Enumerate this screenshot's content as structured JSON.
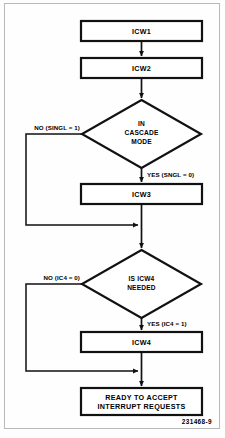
{
  "figure": {
    "type": "flowchart",
    "figure_code": "231468-9",
    "nodes": [
      {
        "id": "icw1",
        "shape": "process",
        "label": "ICW1"
      },
      {
        "id": "icw2",
        "shape": "process",
        "label": "ICW2"
      },
      {
        "id": "cascade_decision",
        "shape": "decision",
        "label_lines": [
          "IN",
          "CASCADE",
          "MODE"
        ]
      },
      {
        "id": "icw3",
        "shape": "process",
        "label": "ICW3"
      },
      {
        "id": "icw4_decision",
        "shape": "decision",
        "label_lines": [
          "IS ICW4",
          "NEEDED"
        ]
      },
      {
        "id": "icw4",
        "shape": "process",
        "label": "ICW4"
      },
      {
        "id": "ready",
        "shape": "process",
        "label_lines": [
          "READY TO ACCEPT",
          "INTERRUPT REQUESTS"
        ]
      }
    ],
    "edges": [
      {
        "from": "icw1",
        "to": "icw2",
        "label": ""
      },
      {
        "from": "icw2",
        "to": "cascade_decision",
        "label": ""
      },
      {
        "from": "cascade_decision",
        "to": "icw4_decision",
        "label": "NO (SINGL = 1)",
        "branch": "no"
      },
      {
        "from": "cascade_decision",
        "to": "icw3",
        "label": "YES (SNGL = 0)",
        "branch": "yes"
      },
      {
        "from": "icw3",
        "to": "icw4_decision",
        "label": ""
      },
      {
        "from": "icw4_decision",
        "to": "ready",
        "label": "NO (IC4 = 0)",
        "branch": "no"
      },
      {
        "from": "icw4_decision",
        "to": "icw4",
        "label": "YES (IC4 = 1)",
        "branch": "yes"
      },
      {
        "from": "icw4",
        "to": "ready",
        "label": ""
      }
    ]
  },
  "labels": {
    "icw1": "ICW1",
    "icw2": "ICW2",
    "icw3": "ICW3",
    "icw4": "ICW4",
    "cascade_line1": "IN",
    "cascade_line2": "CASCADE",
    "cascade_line3": "MODE",
    "icw4q_line1": "IS ICW4",
    "icw4q_line2": "NEEDED",
    "ready_line1": "READY TO ACCEPT",
    "ready_line2": "INTERRUPT REQUESTS",
    "no_singl": "NO (SINGL = 1)",
    "yes_sngl": "YES (SNGL = 0)",
    "no_ic4": "NO (IC4 = 0)",
    "yes_ic4": "YES (IC4 = 1)",
    "figure_code": "231468-9"
  },
  "colors": {
    "stroke": "#111111",
    "fill": "#ffffff",
    "frame": "#b9b9b9",
    "page": "#fdfdfd"
  }
}
